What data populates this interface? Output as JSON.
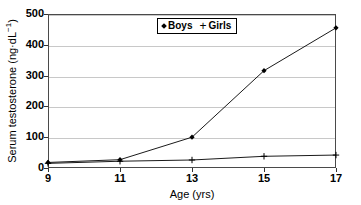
{
  "chart_data": {
    "type": "line",
    "title": "",
    "xlabel": "Age (yrs)",
    "ylabel": "Serum testosterone (ng·dL",
    "ylabel_sup": "−1",
    "ylabel_tail": ")",
    "x": [
      9,
      11,
      13,
      15,
      17
    ],
    "xtick_labels": [
      "9",
      "11",
      "13",
      "15",
      "17"
    ],
    "ytick_labels": [
      "0",
      "100",
      "200",
      "300",
      "400",
      "500"
    ],
    "yticks": [
      0,
      100,
      200,
      300,
      400,
      500
    ],
    "xlim": [
      9,
      17
    ],
    "ylim": [
      0,
      500
    ],
    "grid": true,
    "legend_position": "top-center",
    "series": [
      {
        "name": "Boys",
        "marker": "diamond",
        "color": "#000000",
        "values": [
          18,
          27,
          100,
          316,
          455
        ]
      },
      {
        "name": "Girls",
        "marker": "plus",
        "color": "#000000",
        "values": [
          15,
          22,
          26,
          38,
          42
        ]
      }
    ]
  },
  "legend": {
    "items": [
      {
        "label": "Boys",
        "marker": "diamond"
      },
      {
        "label": "Girls",
        "marker": "plus"
      }
    ]
  }
}
